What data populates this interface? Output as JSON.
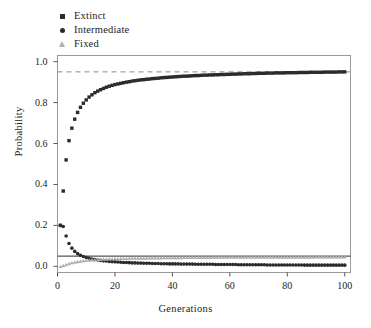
{
  "chart_data": {
    "type": "scatter",
    "title": "",
    "xlabel": "Generations",
    "ylabel": "Probability",
    "xlim": [
      0,
      102
    ],
    "ylim": [
      -0.03,
      1.03
    ],
    "xticks": [
      0,
      20,
      40,
      60,
      80,
      100
    ],
    "yticks": [
      "0.0",
      "0.2",
      "0.4",
      "0.6",
      "0.8",
      "1.0"
    ],
    "ytick_values": [
      0.0,
      0.2,
      0.4,
      0.6,
      0.8,
      1.0
    ],
    "grid": false,
    "legend_position": "above-left",
    "reference_lines": [
      {
        "name": "extinction-asymptote",
        "y": 0.95,
        "style": "dashed",
        "color": "#8a8a8a"
      },
      {
        "name": "fixation-probability",
        "y": 0.05,
        "style": "solid",
        "color": "#2b2b2b"
      }
    ],
    "series": [
      {
        "name": "Extinct",
        "marker": "square",
        "color": "#2b2b2b",
        "x": [
          1,
          2,
          3,
          4,
          5,
          6,
          7,
          8,
          9,
          10,
          11,
          12,
          13,
          14,
          15,
          16,
          17,
          18,
          19,
          20,
          21,
          22,
          23,
          24,
          25,
          26,
          27,
          28,
          29,
          30,
          31,
          32,
          33,
          34,
          35,
          36,
          37,
          38,
          39,
          40,
          41,
          42,
          43,
          44,
          45,
          46,
          47,
          48,
          49,
          50,
          51,
          52,
          53,
          54,
          55,
          56,
          57,
          58,
          59,
          60,
          61,
          62,
          63,
          64,
          65,
          66,
          67,
          68,
          69,
          70,
          71,
          72,
          73,
          74,
          75,
          76,
          77,
          78,
          79,
          80,
          81,
          82,
          83,
          84,
          85,
          86,
          87,
          88,
          89,
          90,
          91,
          92,
          93,
          94,
          95,
          96,
          97,
          98,
          99,
          100
        ],
        "values": [
          0.2,
          0.368,
          0.52,
          0.614,
          0.675,
          0.719,
          0.752,
          0.777,
          0.797,
          0.813,
          0.827,
          0.838,
          0.848,
          0.856,
          0.863,
          0.869,
          0.875,
          0.88,
          0.884,
          0.888,
          0.891,
          0.894,
          0.897,
          0.9,
          0.902,
          0.905,
          0.907,
          0.909,
          0.911,
          0.912,
          0.914,
          0.915,
          0.917,
          0.918,
          0.919,
          0.921,
          0.922,
          0.923,
          0.924,
          0.925,
          0.926,
          0.927,
          0.928,
          0.929,
          0.929,
          0.93,
          0.931,
          0.932,
          0.932,
          0.933,
          0.934,
          0.934,
          0.935,
          0.935,
          0.936,
          0.936,
          0.937,
          0.937,
          0.938,
          0.938,
          0.939,
          0.939,
          0.94,
          0.94,
          0.941,
          0.941,
          0.941,
          0.942,
          0.942,
          0.943,
          0.943,
          0.943,
          0.944,
          0.944,
          0.944,
          0.945,
          0.945,
          0.945,
          0.945,
          0.946,
          0.946,
          0.946,
          0.946,
          0.947,
          0.947,
          0.947,
          0.947,
          0.948,
          0.948,
          0.948,
          0.948,
          0.948,
          0.949,
          0.949,
          0.949,
          0.949,
          0.949,
          0.95,
          0.95,
          0.95
        ]
      },
      {
        "name": "Intermediate",
        "marker": "circle",
        "color": "#2b2b2b",
        "x": [
          1,
          2,
          3,
          4,
          5,
          6,
          7,
          8,
          9,
          10,
          11,
          12,
          13,
          14,
          15,
          16,
          17,
          18,
          19,
          20,
          21,
          22,
          23,
          24,
          25,
          26,
          27,
          28,
          29,
          30,
          31,
          32,
          33,
          34,
          35,
          36,
          37,
          38,
          39,
          40,
          41,
          42,
          43,
          44,
          45,
          46,
          47,
          48,
          49,
          50,
          51,
          52,
          53,
          54,
          55,
          56,
          57,
          58,
          59,
          60,
          61,
          62,
          63,
          64,
          65,
          66,
          67,
          68,
          69,
          70,
          71,
          72,
          73,
          74,
          75,
          76,
          77,
          78,
          79,
          80,
          81,
          82,
          83,
          84,
          85,
          86,
          87,
          88,
          89,
          90,
          91,
          92,
          93,
          94,
          95,
          96,
          97,
          98,
          99,
          100
        ],
        "values": [
          0.2,
          0.195,
          0.148,
          0.112,
          0.089,
          0.073,
          0.062,
          0.054,
          0.048,
          0.043,
          0.039,
          0.036,
          0.033,
          0.031,
          0.029,
          0.027,
          0.026,
          0.024,
          0.023,
          0.022,
          0.021,
          0.02,
          0.019,
          0.019,
          0.018,
          0.017,
          0.017,
          0.016,
          0.016,
          0.015,
          0.015,
          0.015,
          0.014,
          0.014,
          0.014,
          0.013,
          0.013,
          0.013,
          0.012,
          0.012,
          0.012,
          0.012,
          0.011,
          0.011,
          0.011,
          0.011,
          0.011,
          0.01,
          0.01,
          0.01,
          0.01,
          0.01,
          0.01,
          0.01,
          0.009,
          0.009,
          0.009,
          0.009,
          0.009,
          0.009,
          0.009,
          0.009,
          0.008,
          0.008,
          0.008,
          0.008,
          0.008,
          0.008,
          0.008,
          0.008,
          0.008,
          0.008,
          0.007,
          0.007,
          0.007,
          0.007,
          0.007,
          0.007,
          0.007,
          0.007,
          0.007,
          0.007,
          0.007,
          0.007,
          0.007,
          0.006,
          0.006,
          0.006,
          0.006,
          0.006,
          0.006,
          0.006,
          0.006,
          0.006,
          0.006,
          0.006,
          0.006,
          0.006,
          0.006,
          0.006
        ]
      },
      {
        "name": "Fixed",
        "marker": "triangle",
        "color": "#adadad",
        "x": [
          1,
          2,
          3,
          4,
          5,
          6,
          7,
          8,
          9,
          10,
          11,
          12,
          13,
          14,
          15,
          16,
          17,
          18,
          19,
          20,
          21,
          22,
          23,
          24,
          25,
          26,
          27,
          28,
          29,
          30,
          31,
          32,
          33,
          34,
          35,
          36,
          37,
          38,
          39,
          40,
          41,
          42,
          43,
          44,
          45,
          46,
          47,
          48,
          49,
          50,
          51,
          52,
          53,
          54,
          55,
          56,
          57,
          58,
          59,
          60,
          61,
          62,
          63,
          64,
          65,
          66,
          67,
          68,
          69,
          70,
          71,
          72,
          73,
          74,
          75,
          76,
          77,
          78,
          79,
          80,
          81,
          82,
          83,
          84,
          85,
          86,
          87,
          88,
          89,
          90,
          91,
          92,
          93,
          94,
          95,
          96,
          97,
          98,
          99,
          100
        ],
        "values": [
          0.0,
          0.004,
          0.009,
          0.014,
          0.018,
          0.021,
          0.024,
          0.026,
          0.028,
          0.03,
          0.031,
          0.032,
          0.033,
          0.034,
          0.035,
          0.036,
          0.036,
          0.037,
          0.037,
          0.038,
          0.038,
          0.039,
          0.039,
          0.039,
          0.04,
          0.04,
          0.04,
          0.041,
          0.041,
          0.041,
          0.041,
          0.042,
          0.042,
          0.042,
          0.042,
          0.042,
          0.043,
          0.043,
          0.043,
          0.043,
          0.043,
          0.043,
          0.043,
          0.044,
          0.044,
          0.044,
          0.044,
          0.044,
          0.044,
          0.044,
          0.044,
          0.044,
          0.044,
          0.045,
          0.045,
          0.045,
          0.045,
          0.045,
          0.045,
          0.045,
          0.045,
          0.045,
          0.045,
          0.045,
          0.045,
          0.045,
          0.045,
          0.045,
          0.046,
          0.046,
          0.046,
          0.046,
          0.046,
          0.046,
          0.046,
          0.046,
          0.046,
          0.046,
          0.046,
          0.046,
          0.046,
          0.046,
          0.046,
          0.046,
          0.046,
          0.046,
          0.046,
          0.046,
          0.046,
          0.047,
          0.047,
          0.047,
          0.047,
          0.047,
          0.047,
          0.047,
          0.047,
          0.047,
          0.047,
          0.047
        ]
      }
    ]
  },
  "legend": {
    "items": [
      {
        "label": "Extinct",
        "marker": "square"
      },
      {
        "label": "Intermediate",
        "marker": "circle"
      },
      {
        "label": "Fixed",
        "marker": "triangle"
      }
    ]
  }
}
